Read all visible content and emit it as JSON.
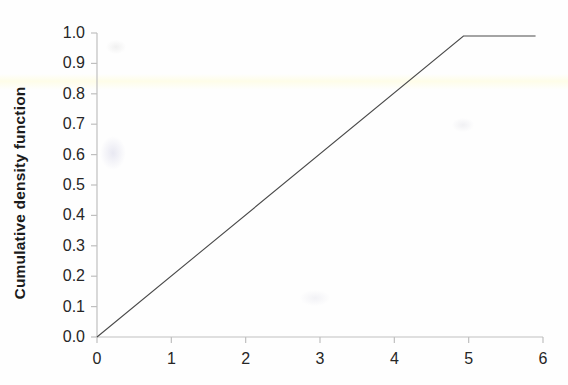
{
  "chart_data": {
    "type": "line",
    "title": "",
    "subtitle": "",
    "xlabel": "",
    "ylabel": "Cumulative  density function",
    "xlim": [
      0,
      6
    ],
    "ylim": [
      0.0,
      1.0
    ],
    "xticks": [
      0,
      1,
      2,
      3,
      4,
      5,
      6
    ],
    "xtick_labels": [
      "0",
      "1",
      "2",
      "3",
      "4",
      "5",
      "6"
    ],
    "yticks": [
      0.0,
      0.1,
      0.2,
      0.3,
      0.4,
      0.5,
      0.6,
      0.7,
      0.8,
      0.9,
      1.0
    ],
    "ytick_labels": [
      "0.0",
      "0.1",
      "0.2",
      "0.3",
      "0.4",
      "0.5",
      "0.6",
      "0.7",
      "0.8",
      "0.9",
      "1.0"
    ],
    "grid": false,
    "legend": false,
    "legend_position": "none",
    "line_color": "#4a4a4a",
    "axis_color": "#bfbfbf",
    "tick_text_color": "#262626",
    "background_color": "#fefefe",
    "series": [
      {
        "name": "CDF",
        "points": [
          [
            0.0,
            0.0
          ],
          [
            4.93,
            0.99
          ],
          [
            5.9,
            0.99
          ]
        ]
      }
    ]
  },
  "axis": {
    "y_title": "Cumulative  density function"
  }
}
